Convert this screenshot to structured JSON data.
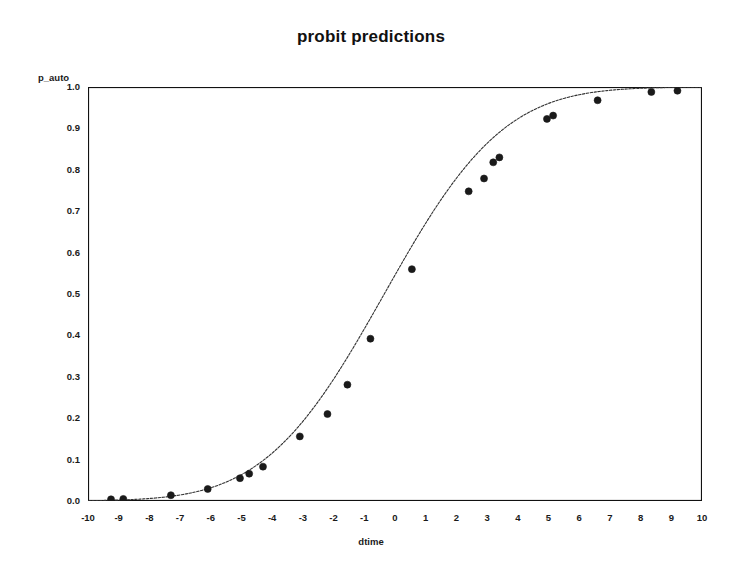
{
  "chart_data": {
    "type": "line",
    "title": "probit predictions",
    "xlabel": "dtime",
    "ylabel": "p_auto",
    "xlim": [
      -10,
      10
    ],
    "ylim": [
      0.0,
      1.0
    ],
    "grid": false,
    "legend": null,
    "legend_position": "none",
    "x_major_step": 1,
    "x_minor_per_major": 5,
    "y_major_step": 0.1,
    "y_minor_per_major": 5,
    "xticks": [
      "-10",
      "-9",
      "-8",
      "-7",
      "-6",
      "-5",
      "-4",
      "-3",
      "-2",
      "-1",
      "0",
      "1",
      "2",
      "3",
      "4",
      "5",
      "6",
      "7",
      "8",
      "9",
      "10"
    ],
    "yticks": [
      "0.0",
      "0.1",
      "0.2",
      "0.3",
      "0.4",
      "0.5",
      "0.6",
      "0.7",
      "0.8",
      "0.9",
      "1.0"
    ],
    "marker": "filled-circle",
    "marker_color": "#1a1a1a",
    "line_style": "dotted",
    "line_color": "#333333",
    "series": [
      {
        "name": "p_auto",
        "x": [
          -9.25,
          -8.85,
          -7.3,
          -6.1,
          -5.05,
          -4.75,
          -4.3,
          -3.1,
          -2.2,
          -1.55,
          -0.8,
          0.55,
          2.4,
          2.9,
          3.2,
          3.4,
          4.95,
          5.15,
          6.6,
          8.35,
          9.2
        ],
        "y": [
          0.004,
          0.005,
          0.014,
          0.029,
          0.055,
          0.066,
          0.083,
          0.156,
          0.21,
          0.281,
          0.392,
          0.56,
          0.748,
          0.779,
          0.818,
          0.83,
          0.923,
          0.931,
          0.968,
          0.988,
          0.991
        ]
      }
    ],
    "curve": {
      "description": "probit (normal CDF) fit through the plotted points",
      "mean": -0.35,
      "sd": 3.05
    }
  },
  "axis_colors": {
    "frame": "#111111",
    "text": "#1a1a1a",
    "background": "#ffffff"
  }
}
